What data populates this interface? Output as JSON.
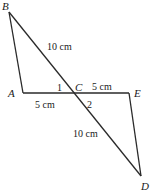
{
  "diagram": {
    "type": "geometry",
    "line_color": "#2a2a2a",
    "points": {
      "A": {
        "label": "A",
        "x": 23,
        "y": 93
      },
      "B": {
        "label": "B",
        "x": 9,
        "y": 12
      },
      "C": {
        "label": "C",
        "x": 73,
        "y": 93
      },
      "D": {
        "label": "D",
        "x": 141,
        "y": 176
      },
      "E": {
        "label": "E",
        "x": 129,
        "y": 93
      }
    },
    "segments": [
      {
        "from": "A",
        "to": "B"
      },
      {
        "from": "B",
        "to": "D",
        "via": "C"
      },
      {
        "from": "A",
        "to": "E",
        "via": "C"
      },
      {
        "from": "E",
        "to": "D"
      }
    ],
    "measurements": {
      "BC": "10 cm",
      "AC": "5 cm",
      "CE": "5 cm",
      "CD": "10 cm"
    },
    "angles": {
      "angle1": "1",
      "angle2": "2"
    }
  }
}
